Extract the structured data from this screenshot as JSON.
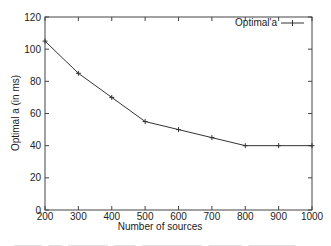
{
  "chart_data": {
    "type": "line",
    "title": "",
    "xlabel": "Number of sources",
    "ylabel": "Optimal a (in ms)",
    "x": [
      200,
      300,
      400,
      500,
      600,
      700,
      800,
      900,
      1000
    ],
    "series": [
      {
        "name": "Optimal'a",
        "values": [
          105,
          85,
          70,
          55,
          50,
          45,
          40,
          40,
          40
        ],
        "marker": "plus",
        "color": "#333333"
      }
    ],
    "xlim": [
      200,
      1000
    ],
    "ylim": [
      0,
      120
    ],
    "xticks": [
      "200",
      "300",
      "400",
      "500",
      "600",
      "700",
      "800",
      "900",
      "1000"
    ],
    "yticks": [
      "0",
      "20",
      "40",
      "60",
      "80",
      "100",
      "120"
    ],
    "grid": false,
    "legend_position": "top-right"
  },
  "legend": {
    "label": "Optimal'a"
  },
  "axes": {
    "xlabel": "Number of sources",
    "ylabel": "Optimal a (in ms)"
  }
}
